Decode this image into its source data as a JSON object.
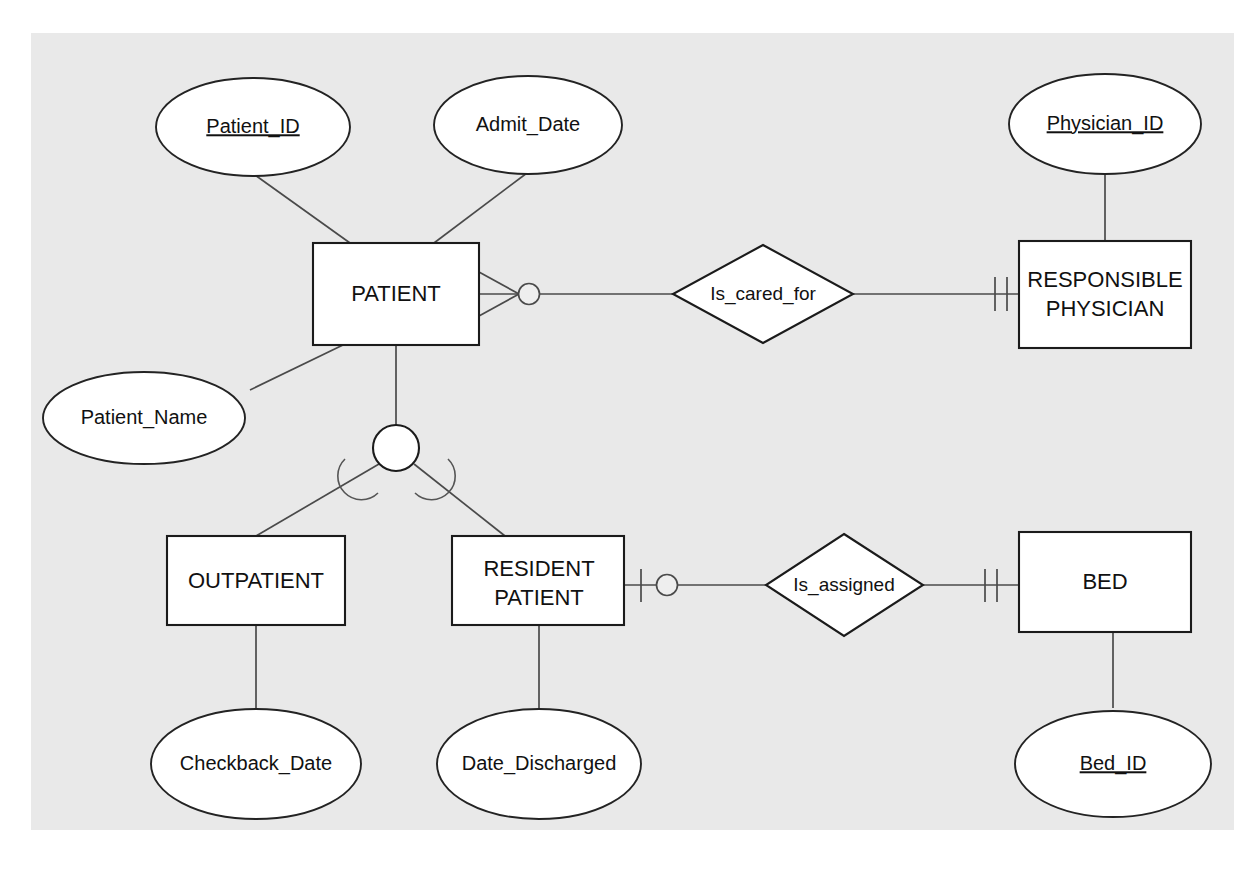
{
  "diagram": {
    "type": "entity-relationship-diagram",
    "notation": "crows-foot",
    "background_color": "#e9e9e9",
    "page_color": "#ffffff",
    "line_color": "#4a4a4a",
    "shape_fill": "#ffffff",
    "shape_stroke": "#1b1b1b"
  },
  "entities": [
    {
      "id": "patient",
      "label": "PATIENT",
      "lines": [
        "PATIENT"
      ]
    },
    {
      "id": "physician",
      "label": "RESPONSIBLE PHYSICIAN",
      "lines": [
        "RESPONSIBLE",
        "PHYSICIAN"
      ]
    },
    {
      "id": "outpatient",
      "label": "OUTPATIENT",
      "lines": [
        "OUTPATIENT"
      ]
    },
    {
      "id": "resident",
      "label": "RESIDENT PATIENT",
      "lines": [
        "RESIDENT",
        "PATIENT"
      ]
    },
    {
      "id": "bed",
      "label": "BED",
      "lines": [
        "BED"
      ]
    }
  ],
  "attributes": [
    {
      "id": "patient_id",
      "label": "Patient_ID",
      "key": true,
      "owner": "patient"
    },
    {
      "id": "admit_date",
      "label": "Admit_Date",
      "key": false,
      "owner": "patient"
    },
    {
      "id": "patient_name",
      "label": "Patient_Name",
      "key": false,
      "owner": "patient"
    },
    {
      "id": "physician_id",
      "label": "Physician_ID",
      "key": true,
      "owner": "physician"
    },
    {
      "id": "checkback_date",
      "label": "Checkback_Date",
      "key": false,
      "owner": "outpatient"
    },
    {
      "id": "date_discharged",
      "label": "Date_Discharged",
      "key": false,
      "owner": "resident"
    },
    {
      "id": "bed_id",
      "label": "Bed_ID",
      "key": true,
      "owner": "bed"
    }
  ],
  "relationships": [
    {
      "id": "is_cared_for",
      "label": "Is_cared_for",
      "from": "PATIENT",
      "to": "RESPONSIBLE PHYSICIAN",
      "from_cardinality": "optional-many",
      "to_cardinality": "mandatory-one"
    },
    {
      "id": "is_assigned",
      "label": "Is_assigned",
      "from": "RESIDENT PATIENT",
      "to": "BED",
      "from_cardinality": "optional-one",
      "to_cardinality": "mandatory-one"
    }
  ],
  "supertype": {
    "id": "patient_subtype_group",
    "parent": "PATIENT",
    "children": [
      "OUTPATIENT",
      "RESIDENT PATIENT"
    ],
    "connector": "circle",
    "constraint": "disjoint-arcs"
  }
}
